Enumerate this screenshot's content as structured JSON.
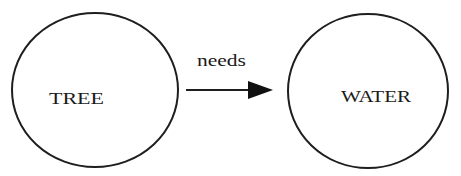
{
  "diagram": {
    "type": "concept-map",
    "nodes": [
      {
        "id": "tree",
        "label": "TREE"
      },
      {
        "id": "water",
        "label": "WATER"
      }
    ],
    "edges": [
      {
        "from": "tree",
        "to": "water",
        "label": "needs"
      }
    ],
    "colors": {
      "stroke": "#1e1e1e",
      "background": "#ffffff",
      "text": "#1a1a1a"
    }
  }
}
